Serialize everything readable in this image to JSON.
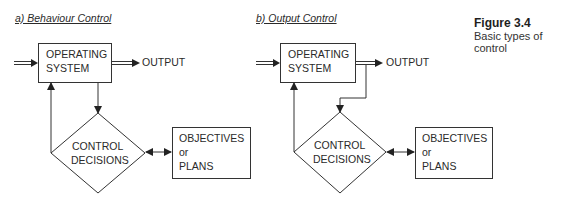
{
  "figure": {
    "number": "Figure 3.4",
    "caption": "Basic types of control"
  },
  "panels": [
    {
      "title": "a) Behaviour Control",
      "operating_system": [
        "OPERATING",
        "SYSTEM"
      ],
      "output": "OUTPUT",
      "decision": [
        "CONTROL",
        "DECISIONS"
      ],
      "objectives": [
        "OBJECTIVES",
        "or",
        "PLANS"
      ]
    },
    {
      "title": "b) Output Control",
      "operating_system": [
        "OPERATING",
        "SYSTEM"
      ],
      "output": "OUTPUT",
      "decision": [
        "CONTROL",
        "DECISIONS"
      ],
      "objectives": [
        "OBJECTIVES",
        "or",
        "PLANS"
      ]
    }
  ],
  "colors": {
    "stroke": "#333333",
    "text": "#2a2a2a"
  }
}
